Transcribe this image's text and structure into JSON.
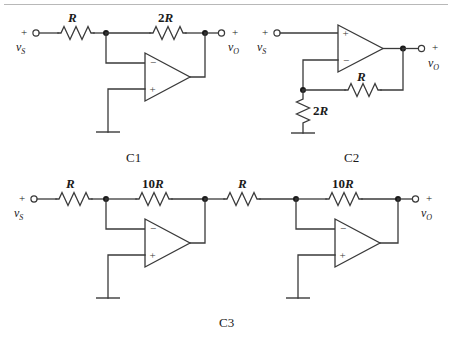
{
  "figure": {
    "caption_c1": "C1",
    "caption_c2": "C2",
    "caption_c3": "C3",
    "source_label": "v",
    "source_sub": "S",
    "output_label": "v",
    "output_sub": "O",
    "plus_sign": "+",
    "minus_sign": "−",
    "colors": {
      "wire": "#3a3a3a",
      "node": "#1a1a1a",
      "background": "#ffffff",
      "rule": "#b8b8b8"
    }
  },
  "circuits": [
    {
      "id": "C1",
      "name": "inverting-amplifier",
      "caption": "C1",
      "input_terminal": {
        "sign": "+",
        "label": "v",
        "sub": "S"
      },
      "output_terminal": {
        "sign": "+",
        "label": "v",
        "sub": "O"
      },
      "resistors": [
        {
          "name": "input-resistor",
          "label": "R",
          "orientation": "horizontal"
        },
        {
          "name": "feedback-resistor",
          "label": "2R",
          "orientation": "horizontal"
        }
      ],
      "opamp": {
        "inverting_pin": "−",
        "noninverting_pin": "+",
        "inverting_pin_position": "top",
        "noninverting_pin_position": "bottom"
      },
      "ground": true
    },
    {
      "id": "C2",
      "name": "noninverting-amplifier",
      "caption": "C2",
      "input_terminal": {
        "sign": "+",
        "label": "v",
        "sub": "S"
      },
      "output_terminal": {
        "sign": "+",
        "label": "v",
        "sub": "O"
      },
      "resistors": [
        {
          "name": "feedback-resistor",
          "label": "R",
          "orientation": "horizontal"
        },
        {
          "name": "gain-resistor",
          "label": "2R",
          "orientation": "vertical"
        }
      ],
      "opamp": {
        "inverting_pin": "−",
        "noninverting_pin": "+",
        "inverting_pin_position": "bottom",
        "noninverting_pin_position": "top"
      },
      "ground": true
    },
    {
      "id": "C3",
      "name": "cascaded-inverting-amplifiers",
      "caption": "C3",
      "input_terminal": {
        "sign": "+",
        "label": "v",
        "sub": "S"
      },
      "output_terminal": {
        "sign": "+",
        "label": "v",
        "sub": "O"
      },
      "resistors": [
        {
          "name": "stage1-input-resistor",
          "label": "R",
          "orientation": "horizontal"
        },
        {
          "name": "stage1-feedback-resistor",
          "label": "10R",
          "orientation": "horizontal"
        },
        {
          "name": "stage2-input-resistor",
          "label": "R",
          "orientation": "horizontal"
        },
        {
          "name": "stage2-feedback-resistor",
          "label": "10R",
          "orientation": "horizontal"
        }
      ],
      "opamp": {
        "inverting_pin": "−",
        "noninverting_pin": "+",
        "inverting_pin_position": "top",
        "noninverting_pin_position": "bottom"
      },
      "stages": 2,
      "ground": true
    }
  ],
  "labels": {
    "c1_r_input": "R",
    "c1_r_feedback_num": "2",
    "c1_r_feedback_unit": "R",
    "c2_r_feedback": "R",
    "c2_r_gain_num": "2",
    "c2_r_gain_unit": "R",
    "c3_r1": "R",
    "c3_rf1_num": "10",
    "c3_rf1_unit": "R",
    "c3_r2": "R",
    "c3_rf2_num": "10",
    "c3_rf2_unit": "R"
  }
}
